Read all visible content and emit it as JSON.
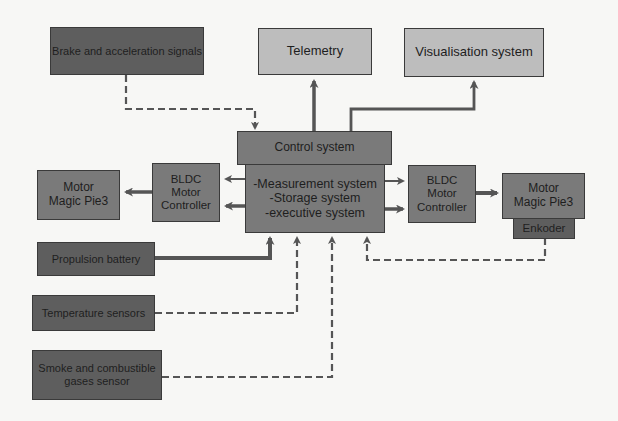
{
  "diagram": {
    "blocks": {
      "brake": "Brake and acceleration signals",
      "telemetry": "Telemetry",
      "visualisation": "Visualisation system",
      "control": "Control system",
      "measurement_line1": "-Measurement system",
      "measurement_line2": "-Storage system",
      "measurement_line3": "-executive system",
      "bldc_left_line1": "BLDC",
      "bldc_left_line2": "Motor",
      "bldc_left_line3": "Controller",
      "motor_left_line1": "Motor",
      "motor_left_line2": "Magic Pie3",
      "bldc_right_line1": "BLDC",
      "bldc_right_line2": "Motor",
      "bldc_right_line3": "Controller",
      "motor_right_line1": "Motor",
      "motor_right_line2": "Magic Pie3",
      "encoder": "Enkoder",
      "battery": "Propulsion battery",
      "temperature": "Temperature sensors",
      "smoke_line1": "Smoke and combustible",
      "smoke_line2": "gases sensor"
    },
    "connections": [
      {
        "from": "Brake and acceleration signals",
        "to": "Control system",
        "style": "dashed"
      },
      {
        "from": "Control system",
        "to": "Telemetry",
        "style": "solid"
      },
      {
        "from": "Control system",
        "to": "Visualisation system",
        "style": "solid"
      },
      {
        "from": "Measurement system",
        "to": "BLDC Motor Controller (left)",
        "style": "solid"
      },
      {
        "from": "BLDC Motor Controller (left)",
        "to": "Motor Magic Pie3 (left)",
        "style": "solid"
      },
      {
        "from": "Measurement system",
        "to": "BLDC Motor Controller (right)",
        "style": "solid"
      },
      {
        "from": "BLDC Motor Controller (right)",
        "to": "Motor Magic Pie3 (right)",
        "style": "solid"
      },
      {
        "from": "Propulsion battery",
        "to": "Measurement system",
        "style": "solid"
      },
      {
        "from": "Temperature sensors",
        "to": "Measurement system",
        "style": "dashed"
      },
      {
        "from": "Smoke and combustible gases sensor",
        "to": "Measurement system",
        "style": "dashed"
      },
      {
        "from": "Enkoder",
        "to": "Measurement system",
        "style": "dashed"
      }
    ],
    "colors": {
      "dark_block": "#5e5e5e",
      "mid_block": "#7a7a7a",
      "light_block": "#bdbdbd",
      "wire": "#555555"
    }
  }
}
